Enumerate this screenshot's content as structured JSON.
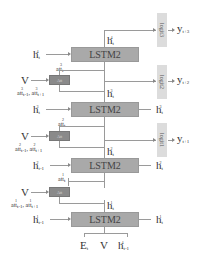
{
  "diagram": {
    "lstm_blocks": [
      {
        "label": "LSTM2",
        "level": 4
      },
      {
        "label": "LSTM2",
        "level": 3
      },
      {
        "label": "LSTM2",
        "level": 2
      },
      {
        "label": "LSTM2",
        "level": 1
      }
    ],
    "att_blocks": [
      {
        "label": "Att"
      },
      {
        "label": "Att"
      },
      {
        "label": "Att"
      }
    ],
    "logits": [
      {
        "label": "logit3",
        "output": "y",
        "output_sub": "t+3"
      },
      {
        "label": "logit2",
        "output": "y",
        "output_sub": "t+2"
      },
      {
        "label": "logit1",
        "output": "y",
        "output_sub": "t+1"
      }
    ],
    "left_inputs": [
      {
        "base": "h",
        "sup": "4",
        "sub": "t"
      },
      {
        "base": "h",
        "sup": "3",
        "sub": "t"
      },
      {
        "base": "h",
        "sup": "2",
        "sub": "t-1"
      },
      {
        "base": "h",
        "sup": "1",
        "sub": "t-1"
      }
    ],
    "right_outputs": [
      {
        "base": "h",
        "sup": "3",
        "sub": "t"
      },
      {
        "base": "h",
        "sup": "2",
        "sub": "t"
      },
      {
        "base": "h",
        "sup": "1",
        "sub": "t"
      }
    ],
    "vertical_states": [
      {
        "base": "h",
        "sup": "4",
        "sub": "t"
      },
      {
        "base": "h",
        "sup": "3",
        "sub": "t"
      },
      {
        "base": "h",
        "sup": "2",
        "sub": "t"
      },
      {
        "base": "h",
        "sup": "1",
        "sub": "t"
      }
    ],
    "att_outputs": [
      {
        "base": "att",
        "sup": "3",
        "sub": "t"
      },
      {
        "base": "att",
        "sup": "2",
        "sub": "t"
      },
      {
        "base": "att",
        "sup": "1",
        "sub": "t"
      }
    ],
    "att_inputs": [
      {
        "text": "att",
        "a_sup": "3",
        "a_sub": "t-1",
        "b_sup": "3",
        "b_sub": "t+1"
      },
      {
        "text": "att",
        "a_sup": "2",
        "a_sub": "t-1",
        "b_sup": "2",
        "b_sub": "t+1"
      },
      {
        "text": "att",
        "a_sup": "1",
        "a_sub": "t-1",
        "b_sup": "1",
        "b_sub": "t+1"
      }
    ],
    "v_label": "V",
    "bottom_inputs": [
      {
        "base": "E",
        "sub": "t"
      },
      {
        "base": "V",
        "sub": ""
      },
      {
        "base": "h",
        "sup": "4",
        "sub": "t-1"
      }
    ]
  }
}
